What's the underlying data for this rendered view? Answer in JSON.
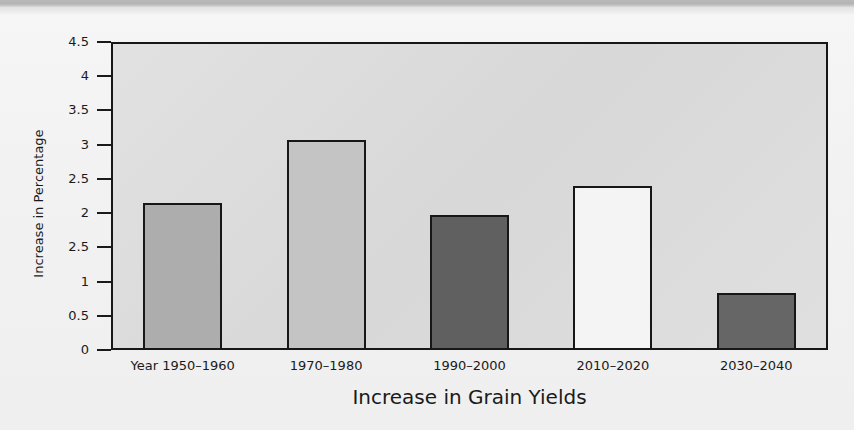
{
  "chart_data": {
    "type": "bar",
    "title": "",
    "xlabel": "Increase in Grain Yields",
    "ylabel": "Increase in Percentage",
    "categories": [
      "Year 1950–1960",
      "1970–1980",
      "1990–2000",
      "2010–2020",
      "2030–2040"
    ],
    "values": [
      2.15,
      3.07,
      1.97,
      2.4,
      0.83
    ],
    "series": [
      {
        "name": "Increase in Percentage",
        "values": [
          2.15,
          3.07,
          1.97,
          2.4,
          0.83
        ]
      }
    ],
    "bar_colors": [
      "#adadad",
      "#c4c4c4",
      "#606060",
      "#f4f4f4",
      "#666666"
    ],
    "ylim": [
      0,
      4.5
    ],
    "y_ticks": [
      0,
      0.5,
      1,
      1.5,
      2,
      2.5,
      3,
      3.5,
      4,
      4.5
    ],
    "y_tick_labels": [
      "0",
      "0.5",
      "1",
      "2.5",
      "2",
      "2.5",
      "3",
      "3.5",
      "4",
      "4.5"
    ],
    "grid": false,
    "legend": "none",
    "plot_background": "#dcdcdc",
    "axis_color": "#171717",
    "note_ytick_anomaly": "2.5"
  },
  "axes": {
    "x_title": "Increase in Grain Yields",
    "y_title": "Increase in Percentage"
  },
  "y_ticks": [
    {
      "label": "4.5",
      "value": 4.5
    },
    {
      "label": "4",
      "value": 4
    },
    {
      "label": "3.5",
      "value": 3.5
    },
    {
      "label": "3",
      "value": 3
    },
    {
      "label": "2.5",
      "value": 2.5
    },
    {
      "label": "2",
      "value": 2
    },
    {
      "label": "2.5",
      "value": 1.5
    },
    {
      "label": "1",
      "value": 1
    },
    {
      "label": "0.5",
      "value": 0.5
    },
    {
      "label": "0",
      "value": 0
    }
  ],
  "bars": [
    {
      "label": "Year 1950–1960",
      "value": 2.15,
      "color": "#adadad"
    },
    {
      "label": "1970–1980",
      "value": 3.07,
      "color": "#c4c4c4"
    },
    {
      "label": "1990–2000",
      "value": 1.97,
      "color": "#606060"
    },
    {
      "label": "2010–2020",
      "value": 2.4,
      "color": "#f4f4f4"
    },
    {
      "label": "2030–2040",
      "value": 0.83,
      "color": "#666666"
    }
  ]
}
